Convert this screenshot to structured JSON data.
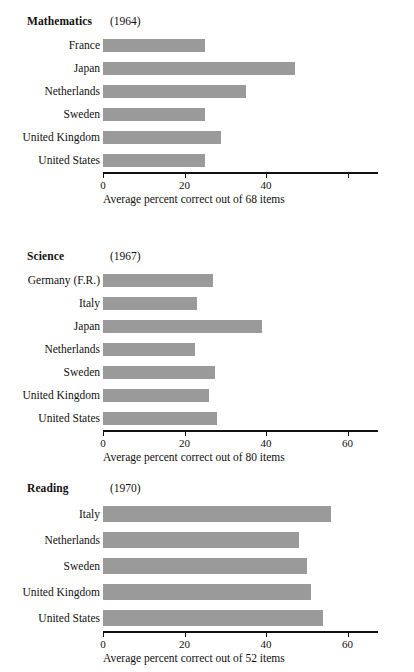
{
  "document": {
    "kind": "three-panel-horizontal-bar-figure",
    "background_color": "#ffffff",
    "bar_color": "#9a9a9a",
    "axis_color": "#111111"
  },
  "panels": [
    {
      "title": "Mathematics",
      "year": "(1964)",
      "caption": "Average percent correct out of 68 items",
      "tick_labels": [
        "0",
        "20",
        "40",
        ""
      ],
      "tick_values": [
        0,
        20,
        40,
        60
      ],
      "categories": [
        "France",
        "Japan",
        "Netherlands",
        "Sweden",
        "United Kingdom",
        "United States"
      ],
      "values": [
        25,
        47,
        35,
        25,
        29,
        25
      ]
    },
    {
      "title": "Science",
      "year": "(1967)",
      "caption": "Average percent correct out of 80 items",
      "tick_labels": [
        "0",
        "20",
        "40",
        "60"
      ],
      "tick_values": [
        0,
        20,
        40,
        60
      ],
      "categories": [
        "Germany (F.R.)",
        "Italy",
        "Japan",
        "Netherlands",
        "Sweden",
        "United Kingdom",
        "United States"
      ],
      "values": [
        27,
        23,
        39,
        22.5,
        27.5,
        26,
        28
      ]
    },
    {
      "title": "Reading",
      "year": "(1970)",
      "caption": "Average percent correct out of 52 items",
      "tick_labels": [
        "0",
        "20",
        "40",
        "60"
      ],
      "tick_values": [
        0,
        20,
        40,
        60
      ],
      "categories": [
        "Italy",
        "Netherlands",
        "Sweden",
        "United Kingdom",
        "United States"
      ],
      "values": [
        56,
        48,
        50,
        51,
        54
      ]
    }
  ],
  "chart_data": [
    {
      "type": "bar",
      "orientation": "horizontal",
      "title": "Mathematics (1964)",
      "xlabel": "Average percent correct out of 68 items",
      "ylabel": "",
      "categories": [
        "France",
        "Japan",
        "Netherlands",
        "Sweden",
        "United Kingdom",
        "United States"
      ],
      "values": [
        25,
        47,
        35,
        25,
        29,
        25
      ],
      "xlim": [
        0,
        67.5
      ],
      "xticks": [
        0,
        20,
        40,
        60
      ],
      "xticklabels": [
        "0",
        "20",
        "40",
        ""
      ],
      "grid": false,
      "legend": "none"
    },
    {
      "type": "bar",
      "orientation": "horizontal",
      "title": "Science (1967)",
      "xlabel": "Average percent correct out of 80 items",
      "ylabel": "",
      "categories": [
        "Germany (F.R.)",
        "Italy",
        "Japan",
        "Netherlands",
        "Sweden",
        "United Kingdom",
        "United States"
      ],
      "values": [
        27,
        23,
        39,
        22.5,
        27.5,
        26,
        28
      ],
      "xlim": [
        0,
        67.5
      ],
      "xticks": [
        0,
        20,
        40,
        60
      ],
      "xticklabels": [
        "0",
        "20",
        "40",
        "60"
      ],
      "grid": false,
      "legend": "none"
    },
    {
      "type": "bar",
      "orientation": "horizontal",
      "title": "Reading (1970)",
      "xlabel": "Average percent correct out of 52 items",
      "ylabel": "",
      "categories": [
        "Italy",
        "Netherlands",
        "Sweden",
        "United Kingdom",
        "United States"
      ],
      "values": [
        56,
        48,
        50,
        51,
        54
      ],
      "xlim": [
        0,
        67.5
      ],
      "xticks": [
        0,
        20,
        40,
        60
      ],
      "xticklabels": [
        "0",
        "20",
        "40",
        "60"
      ],
      "grid": false,
      "legend": "none"
    }
  ]
}
